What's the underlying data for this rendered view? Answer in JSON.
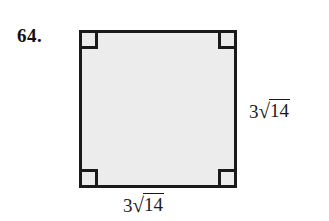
{
  "problem": {
    "number_label": "64."
  },
  "figure": {
    "shape_name": "square",
    "fill_color": "#ececec",
    "stroke_color": "#1a1a1a",
    "right_angle_marks": 4,
    "corner_marks": [
      {
        "position": "top-left"
      },
      {
        "position": "top-right"
      },
      {
        "position": "bottom-left"
      },
      {
        "position": "bottom-right"
      }
    ],
    "labels": {
      "right_side": {
        "full_text": "3√14",
        "coefficient": "3",
        "surd": "√",
        "radicand": "14"
      },
      "bottom_side": {
        "full_text": "3√14",
        "coefficient": "3",
        "surd": "√",
        "radicand": "14"
      }
    }
  }
}
